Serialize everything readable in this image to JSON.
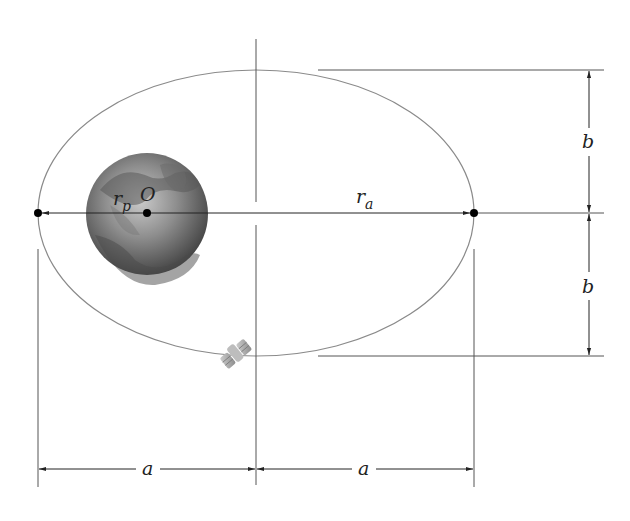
{
  "figure": {
    "type": "elliptical-orbit-diagram",
    "labels": {
      "periapsis_radius": "r",
      "periapsis_sub": "p",
      "apoapsis_radius": "r",
      "apoapsis_sub": "a",
      "focus": "O",
      "semi_minor_upper": "b",
      "semi_minor_lower": "b",
      "semi_major_left": "a",
      "semi_major_right": "a"
    },
    "objects": {
      "central_body": "earth",
      "orbiter": "satellite"
    },
    "colors": {
      "line": "#555555",
      "orbit": "#8a8a8a",
      "dot": "#000000",
      "planet_dark": "#3f3f3f",
      "planet_light": "#b8b8b8",
      "satellite": "#a0a0a0"
    }
  }
}
